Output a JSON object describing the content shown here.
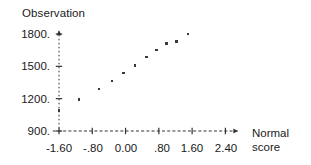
{
  "chart_data": {
    "type": "scatter",
    "title": "",
    "xlabel": "Normal score",
    "ylabel": "Observation",
    "xlabel_line1": "Normal",
    "xlabel_line2": "score",
    "x": [
      -1.6,
      -1.12,
      -0.64,
      -0.33,
      -0.05,
      0.23,
      0.51,
      0.75,
      0.99,
      1.22,
      1.5
    ],
    "y": [
      1090,
      1190,
      1290,
      1365,
      1440,
      1510,
      1585,
      1650,
      1710,
      1730,
      1800
    ],
    "points": [
      {
        "x": -1.6,
        "y": 1090
      },
      {
        "x": -1.12,
        "y": 1190
      },
      {
        "x": -0.64,
        "y": 1290
      },
      {
        "x": -0.33,
        "y": 1365
      },
      {
        "x": -0.05,
        "y": 1440
      },
      {
        "x": 0.23,
        "y": 1510
      },
      {
        "x": 0.51,
        "y": 1585
      },
      {
        "x": 0.75,
        "y": 1650
      },
      {
        "x": 0.99,
        "y": 1710
      },
      {
        "x": 1.22,
        "y": 1730
      },
      {
        "x": 1.5,
        "y": 1800
      }
    ],
    "xticks": [
      -1.6,
      -0.8,
      0.0,
      0.8,
      1.6,
      2.4
    ],
    "xticklabels": [
      "-1.60",
      "-.80",
      "0.00",
      ".80",
      "1.60",
      "2.40"
    ],
    "yticks": [
      900,
      1200,
      1500,
      1800
    ],
    "yticklabels": [
      "900.",
      "1200.",
      "1500.",
      "1800."
    ],
    "xlim": [
      -1.9,
      2.75
    ],
    "ylim": [
      855,
      1830
    ],
    "grid": false,
    "legend": false,
    "marker_color": "#3a3a3a",
    "axis_color": "#333333",
    "axis_style": "dashed-with-arrow"
  },
  "axes": {
    "y_title": "Observation",
    "x_title_line1": "Normal",
    "x_title_line2": "score",
    "y_tick_labels": [
      "1800.",
      "1500.",
      "1200.",
      "900."
    ],
    "x_tick_labels": [
      "-1.60",
      "-.80",
      "0.00",
      ".80",
      "1.60",
      "2.40"
    ]
  }
}
